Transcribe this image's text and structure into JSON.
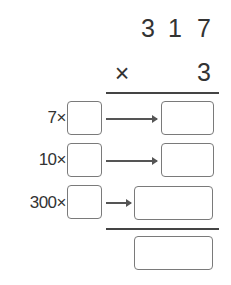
{
  "problem": {
    "multiplicand_digits": [
      "3",
      "1",
      "7"
    ],
    "operator": "×",
    "multiplier": "3"
  },
  "rows": [
    {
      "label": "7×"
    },
    {
      "label": "10×"
    },
    {
      "label": "300×"
    }
  ]
}
